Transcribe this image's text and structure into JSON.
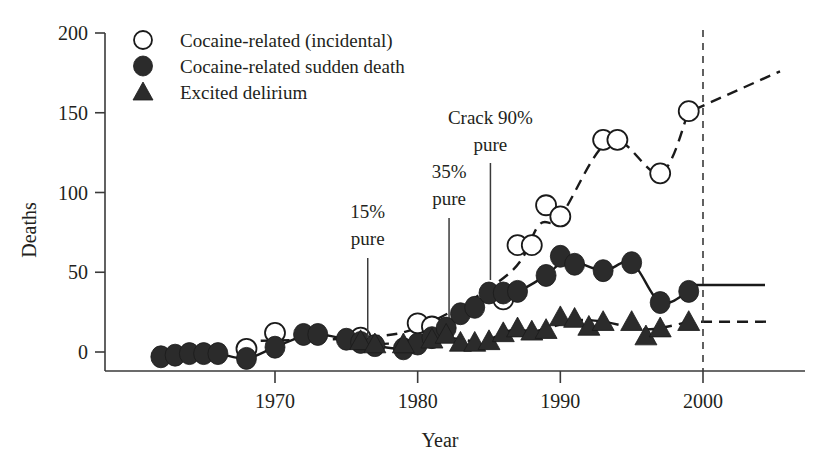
{
  "chart_data": {
    "type": "scatter",
    "title": "",
    "xlabel": "Year",
    "ylabel": "Deaths",
    "xlim": [
      1961,
      2003
    ],
    "ylim": [
      -12,
      200
    ],
    "grid": false,
    "legend_position": "top-left",
    "xticks": [
      "1970",
      "1980",
      "1990",
      "2000"
    ],
    "xtick_values": [
      1970,
      1980,
      1990,
      2000
    ],
    "yticks": [
      "0",
      "50",
      "100",
      "150",
      "200"
    ],
    "ytick_values": [
      0,
      50,
      100,
      150,
      200
    ],
    "series": [
      {
        "name": "Cocaine-related (incidental)",
        "marker": "open-circle",
        "trend": "dashed",
        "x": [
          1968,
          1970,
          1976,
          1980,
          1981,
          1986,
          1987,
          1988,
          1989,
          1990,
          1993,
          1994,
          1997,
          1999
        ],
        "values": [
          2,
          12,
          9,
          18,
          16,
          33,
          67,
          67,
          92,
          85,
          133,
          133,
          112,
          151
        ]
      },
      {
        "name": "Cocaine-related sudden death",
        "marker": "filled-circle",
        "trend": "solid",
        "x": [
          1962,
          1963,
          1964,
          1965,
          1966,
          1968,
          1970,
          1972,
          1973,
          1975,
          1976,
          1977,
          1979,
          1980,
          1981,
          1982,
          1983,
          1984,
          1985,
          1986,
          1987,
          1989,
          1990,
          1991,
          1993,
          1995,
          1997,
          1999
        ],
        "values": [
          -3,
          -2,
          -1,
          -1,
          -1,
          -4,
          3,
          11,
          11,
          8,
          6,
          4,
          2,
          5,
          9,
          15,
          24,
          28,
          37,
          37,
          38,
          48,
          60,
          55,
          51,
          56,
          31,
          38
        ]
      },
      {
        "name": "Excited delirium",
        "marker": "triangle",
        "trend": "dashed",
        "x": [
          1976,
          1977,
          1979,
          1981,
          1982,
          1983,
          1984,
          1985,
          1986,
          1987,
          1988,
          1989,
          1990,
          1991,
          1992,
          1993,
          1995,
          1996,
          1997,
          1999
        ],
        "values": [
          7,
          5,
          5,
          8,
          11,
          6,
          6,
          7,
          12,
          15,
          13,
          14,
          22,
          21,
          16,
          19,
          19,
          10,
          15,
          19
        ]
      }
    ],
    "annotations": [
      {
        "label_line1": "15%",
        "label_line2": "pure",
        "x_year": 1976.5
      },
      {
        "label_line1": "35%",
        "label_line2": "pure",
        "x_year": 1982.2
      },
      {
        "label_line1": "Crack 90%",
        "label_line2": "pure",
        "x_year": 1985.1
      }
    ],
    "reference_line": {
      "label": "2000",
      "x_year": 2000,
      "style": "dashed-vertical"
    }
  },
  "legend": {
    "items": [
      {
        "label": "Cocaine-related (incidental)",
        "marker": "open-circle"
      },
      {
        "label": "Cocaine-related sudden death",
        "marker": "filled-circle"
      },
      {
        "label": "Excited delirium",
        "marker": "triangle"
      }
    ]
  },
  "colors": {
    "ink": "#231f20",
    "marker_fill": "#2b2b2b",
    "marker_stroke": "#1a1a1a",
    "axis": "#3a3a3a",
    "background": "#ffffff"
  }
}
